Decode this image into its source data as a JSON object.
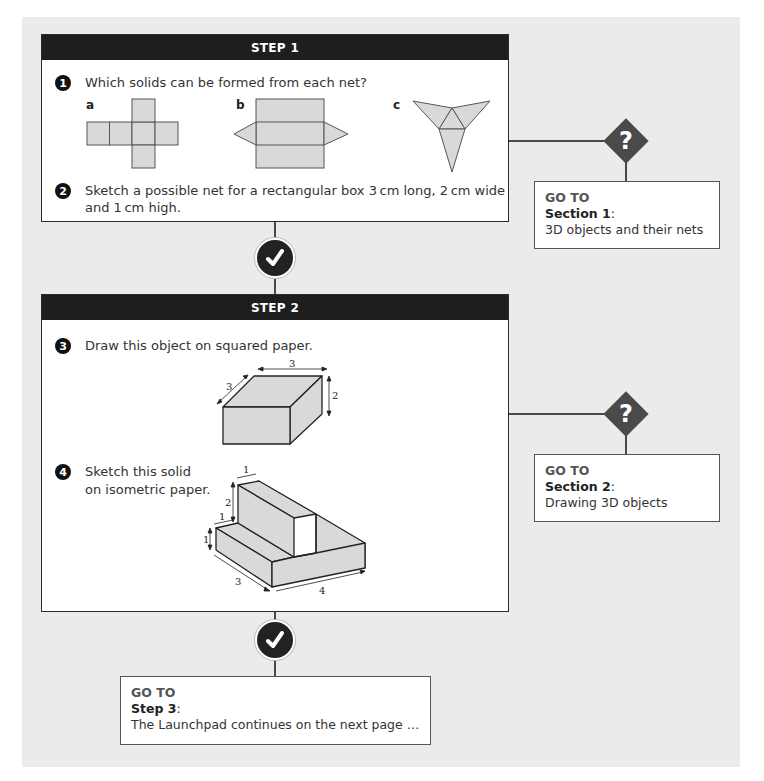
{
  "step1": {
    "header": "STEP 1",
    "q1": {
      "number": "1",
      "text": "Which solids can be formed from each net?",
      "nets": [
        {
          "label": "a",
          "shape": "cube-net"
        },
        {
          "label": "b",
          "shape": "triangular-prism-net"
        },
        {
          "label": "c",
          "shape": "tetrahedron-net"
        }
      ]
    },
    "q2": {
      "number": "2",
      "line1": "Sketch a possible net for a rectangular box 3 cm long, 2 cm wide",
      "line2": "and 1 cm high."
    }
  },
  "step2": {
    "header": "STEP 2",
    "q3": {
      "number": "3",
      "text": "Draw this object on squared paper.",
      "dims": {
        "length": "3",
        "depth": "3",
        "height": "2"
      }
    },
    "q4": {
      "number": "4",
      "line1": "Sketch this solid",
      "line2": "on isometric paper.",
      "dims": {
        "top_width": "1",
        "wall_height": "2",
        "step_width": "1",
        "step_height": "1",
        "depth": "3",
        "length": "4"
      }
    }
  },
  "goto1": {
    "title": "GO TO",
    "section": "Section 1",
    "colon": ":",
    "desc": "3D objects and their nets"
  },
  "goto2": {
    "title": "GO TO",
    "section": "Section 2",
    "colon": ":",
    "desc": "Drawing 3D objects"
  },
  "goto3": {
    "title": "GO TO",
    "section": "Step 3",
    "colon": ":",
    "desc": "The Launchpad continues on the next page …"
  },
  "icons": {
    "check": "checkmark-icon",
    "question": "?"
  },
  "colors": {
    "panel": "#ebebeb",
    "header": "#1e1e1e",
    "shape_fill": "#d9d9d9",
    "line": "#4a4a4a"
  }
}
